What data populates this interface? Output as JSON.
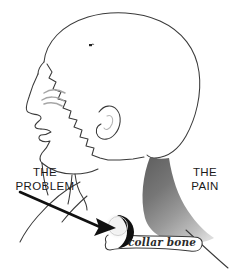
{
  "illustration": {
    "title": "Shoulder pain referral diagram",
    "background_color": "#ffffff",
    "outline_color": "#3a3a3a",
    "labels": {
      "problem_line1": "THE",
      "problem_line2": "PROBLEM",
      "pain_line1": "THE",
      "pain_line2": "PAIN",
      "collar_bone": "collar bone"
    },
    "shading": {
      "pain_gradient_dark": "#6d6d6d",
      "pain_gradient_mid": "#8f8f8f",
      "pain_gradient_light": "#cfcfcf",
      "arrow_color": "#111111",
      "joint_fill": "#111111",
      "bone_fill": "#ffffff",
      "eyebrow_color": "#9a9a9a"
    },
    "annotations": {
      "arrow_target": "shoulder-joint",
      "shaded_region": "trapezius-muscle"
    }
  }
}
